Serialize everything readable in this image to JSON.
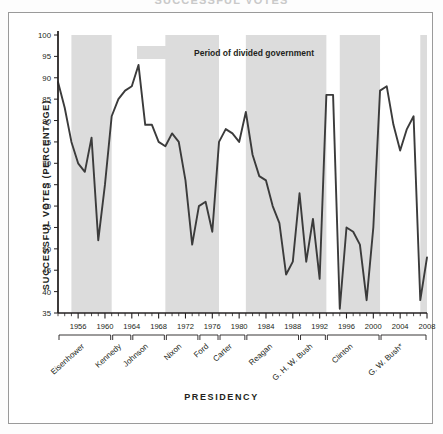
{
  "figure": {
    "clipped_title": "SUCCESSFUL VOTES",
    "xaxis_title": "PRESIDENCY",
    "yaxis_title": "SUCCESSFUL VOTES (PERCENTAGE)"
  },
  "legend": {
    "swatch_color": "#dcdcdc",
    "label": "Period of divided government"
  },
  "colors": {
    "line": "#3b3b3b",
    "shade": "#dcdcdc",
    "axis": "#231f20",
    "frame": "#9a9a9a",
    "background": "#ffffff"
  },
  "chart_data": {
    "type": "line",
    "title": "SUCCESSFUL VOTES",
    "xlabel": "PRESIDENCY",
    "ylabel": "SUCCESSFUL VOTES (PERCENTAGE)",
    "xlim": [
      1953,
      2008
    ],
    "ylim": [
      35,
      100
    ],
    "ytick_values": [
      35,
      40,
      45,
      50,
      55,
      60,
      65,
      70,
      75,
      80,
      85,
      90,
      95,
      100
    ],
    "ytick_labels": [
      "35",
      "40",
      "45",
      "50",
      "55",
      "60",
      "65",
      "70",
      "75",
      "80",
      "85",
      "90",
      "95",
      "100"
    ],
    "xtick_labels": [
      "1956",
      "1960",
      "1964",
      "1968",
      "1972",
      "1976",
      "1980",
      "1984",
      "1988",
      "1992",
      "1996",
      "2000",
      "2004",
      "2008"
    ],
    "xtick_values": [
      1956,
      1960,
      1964,
      1968,
      1972,
      1976,
      1980,
      1984,
      1988,
      1992,
      1996,
      2000,
      2004,
      2008
    ],
    "grid": false,
    "legend_position": "top-center",
    "series": [
      {
        "name": "Presidential success rate on congressional votes",
        "x": [
          1953,
          1954,
          1955,
          1956,
          1957,
          1958,
          1959,
          1960,
          1961,
          1962,
          1963,
          1964,
          1965,
          1966,
          1967,
          1968,
          1969,
          1970,
          1971,
          1972,
          1973,
          1974,
          1975,
          1976,
          1977,
          1978,
          1979,
          1980,
          1981,
          1982,
          1983,
          1984,
          1985,
          1986,
          1987,
          1988,
          1989,
          1990,
          1991,
          1992,
          1993,
          1994,
          1995,
          1996,
          1997,
          1998,
          1999,
          2000,
          2001,
          2002,
          2003,
          2004,
          2005,
          2006,
          2007,
          2008
        ],
        "y": [
          89,
          83,
          75,
          70,
          68,
          76,
          52,
          65,
          81,
          85,
          87,
          88,
          93,
          79,
          79,
          75,
          74,
          77,
          75,
          66,
          51,
          60,
          61,
          54,
          75,
          78,
          77,
          75,
          82,
          72,
          67,
          66,
          60,
          56,
          44,
          47,
          63,
          47,
          57,
          43,
          86,
          86,
          36,
          55,
          54,
          51,
          38,
          55,
          87,
          88,
          79,
          73,
          78,
          81,
          38,
          48
        ]
      }
    ],
    "divided_government_periods": [
      {
        "start": 1955,
        "end": 1961
      },
      {
        "start": 1969,
        "end": 1977
      },
      {
        "start": 1981,
        "end": 1993
      },
      {
        "start": 1995,
        "end": 2001
      },
      {
        "start": 2007,
        "end": 2009
      }
    ]
  },
  "presidencies": [
    {
      "name": "Eisenhower",
      "start": 1953,
      "end": 1961
    },
    {
      "name": "Kennedy",
      "start": 1961,
      "end": 1964
    },
    {
      "name": "Johnson",
      "start": 1964,
      "end": 1969
    },
    {
      "name": "Nixon",
      "start": 1969,
      "end": 1974
    },
    {
      "name": "Ford",
      "start": 1974,
      "end": 1977
    },
    {
      "name": "Carter",
      "start": 1977,
      "end": 1981
    },
    {
      "name": "Reagan",
      "start": 1981,
      "end": 1989
    },
    {
      "name": "G. H. W. Bush",
      "start": 1989,
      "end": 1993
    },
    {
      "name": "Clinton",
      "start": 1993,
      "end": 2001
    },
    {
      "name": "G. W. Bush*",
      "start": 2001,
      "end": 2009
    }
  ]
}
